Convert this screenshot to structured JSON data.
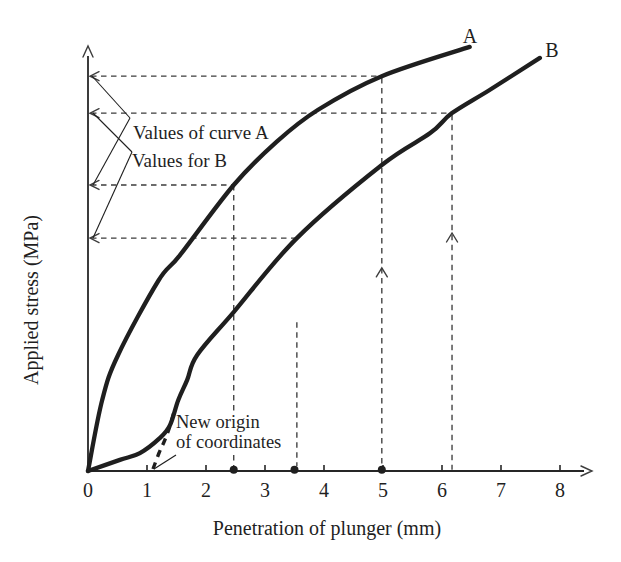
{
  "chart_data": {
    "type": "line",
    "title": "",
    "xlabel": "Penetration of plunger (mm)",
    "ylabel": "Applied stress (MPa)",
    "x_ticks": [
      "0",
      "1",
      "2",
      "3",
      "4",
      "5",
      "6",
      "7",
      "8"
    ],
    "xlim": [
      0,
      8.5
    ],
    "y_axis_unlabeled": true,
    "y_unit_note": "y values given as % of full axis height; the y-axis has no numeric tick labels in the figure",
    "series": [
      {
        "name": "A",
        "points": [
          [
            0,
            0
          ],
          [
            0.24,
            16.7
          ],
          [
            0.51,
            27.3
          ],
          [
            1.19,
            44.7
          ],
          [
            1.56,
            50.8
          ],
          [
            2.47,
            67.3
          ],
          [
            3.2,
            77.5
          ],
          [
            3.9,
            85
          ],
          [
            4.98,
            92.9
          ],
          [
            6.47,
            99.8
          ]
        ]
      },
      {
        "name": "B",
        "points": [
          [
            0,
            0
          ],
          [
            0.54,
            2.6
          ],
          [
            0.88,
            4.2
          ],
          [
            1.22,
            7.8
          ],
          [
            1.39,
            10.8
          ],
          [
            1.53,
            16.7
          ],
          [
            1.68,
            21.4
          ],
          [
            1.85,
            27.3
          ],
          [
            2.47,
            37.4
          ],
          [
            3.54,
            54.8
          ],
          [
            4.98,
            72
          ],
          [
            5.8,
            79.5
          ],
          [
            6.17,
            84.2
          ],
          [
            6.8,
            89.6
          ],
          [
            7.66,
            97.2
          ]
        ]
      }
    ],
    "readouts": {
      "curve_A_at_mm": [
        2.47,
        4.98
      ],
      "curve_B_at_mm": [
        3.54,
        6.17
      ],
      "new_origin_mm": 1.1,
      "h_guides": [
        {
          "pct": 92.9,
          "end_mm": 4.98
        },
        {
          "pct": 84.2,
          "end_mm": 6.17
        },
        {
          "pct": 67.3,
          "end_mm": 2.47
        },
        {
          "pct": 54.8,
          "end_mm": 3.54
        }
      ],
      "v_guides": [
        {
          "mm": 2.47,
          "top_pct": 67.3,
          "bottom_pct": 1.2
        },
        {
          "mm": 3.54,
          "top_pct": 35.0,
          "bottom_pct": 1.2
        },
        {
          "mm": 4.98,
          "top_pct": 92.5,
          "bottom_pct": 1.2,
          "arrow_pct": 47.8
        },
        {
          "mm": 6.17,
          "top_pct": 83.8,
          "bottom_pct": 0.3,
          "arrow_pct": 56.0
        }
      ],
      "axis_dots_mm": [
        2.47,
        3.5,
        4.98
      ]
    },
    "labels": {
      "curve_a": "A",
      "curve_b": "B",
      "values_a": "Values of curve A",
      "values_b": "Values for B",
      "new_origin_line1": "New origin",
      "new_origin_line2": "of coordinates"
    },
    "render": {
      "ink": "#1f1f1f",
      "guide_color": "#3d3d3d",
      "x0": 88,
      "y0": 471,
      "px_per_mm": 59,
      "px_per_pct": 4.25,
      "x_axis_end": 584,
      "x_arrow_tip": 592,
      "y_axis_end": 56,
      "y_arrow_tip": 46,
      "tick_label_y": 497,
      "xlabel_pos": [
        327,
        535
      ],
      "ylabel_pos": [
        38,
        300
      ],
      "curve_a_label_pos": [
        470,
        43
      ],
      "curve_b_label_pos": [
        552,
        57
      ],
      "values_a_pos": [
        133,
        139
      ],
      "values_b_pos": [
        132,
        167
      ],
      "new_origin_pos1": [
        176,
        428
      ],
      "new_origin_pos2": [
        176,
        448
      ],
      "text_masks": [
        [
          174,
          412,
          90,
          19
        ],
        [
          174,
          433,
          110,
          18
        ]
      ],
      "leader_lines": [
        [
          130,
          118,
          92,
          76
        ],
        [
          130,
          118,
          93,
          185
        ],
        [
          132,
          152,
          93,
          113
        ],
        [
          132,
          152,
          93,
          238
        ]
      ],
      "origin_pointer": [
        176,
        455,
        154,
        469
      ],
      "correction_pts": [
        [
          153,
          469
        ],
        [
          159,
          453
        ],
        [
          164,
          442
        ],
        [
          169,
          429
        ],
        [
          174,
          412
        ]
      ]
    }
  }
}
